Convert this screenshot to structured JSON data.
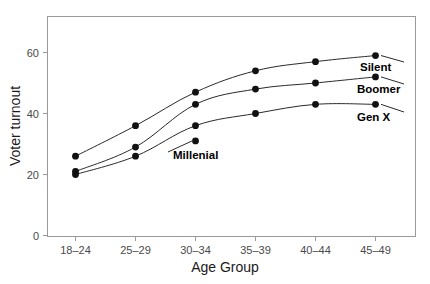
{
  "chart_data": {
    "type": "line",
    "title": "",
    "xlabel": "Age Group",
    "ylabel": "Voter turnout",
    "categories": [
      "18-24",
      "25-29",
      "30-34",
      "35-39",
      "40-44",
      "45-49"
    ],
    "x_tick_labels": [
      "18–24",
      "25–29",
      "30–34",
      "35–39",
      "40–44",
      "45–49"
    ],
    "y_tick_labels": [
      "0",
      "20",
      "40",
      "60"
    ],
    "y_ticks": [
      0,
      20,
      40,
      60
    ],
    "ylim": [
      0,
      68
    ],
    "grid": false,
    "legend_position": "inline-right-end",
    "marker": "filled-circle",
    "series": [
      {
        "name": "Silent",
        "label": "Silent",
        "color": "#111111",
        "values": [
          26,
          36,
          47,
          54,
          57,
          59
        ],
        "label_point_index": 5
      },
      {
        "name": "Boomer",
        "label": "Boomer",
        "color": "#111111",
        "values": [
          21,
          29,
          43,
          48,
          50,
          52
        ],
        "label_point_index": 5
      },
      {
        "name": "Gen X",
        "label": "Gen X",
        "color": "#111111",
        "values": [
          20,
          26,
          36,
          40,
          43,
          43
        ],
        "label_point_index": 5
      },
      {
        "name": "Millenial",
        "label": "Millenial",
        "color": "#111111",
        "values": [
          null,
          null,
          31,
          null,
          null,
          null
        ],
        "label_point_index": 2
      }
    ],
    "annotations": [
      {
        "text": "Silent",
        "series": "Silent"
      },
      {
        "text": "Boomer",
        "series": "Boomer"
      },
      {
        "text": "Gen X",
        "series": "Gen X"
      },
      {
        "text": "Millenial",
        "series": "Millenial"
      }
    ]
  }
}
